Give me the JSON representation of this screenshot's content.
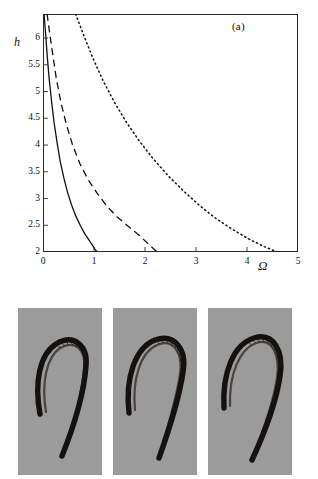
{
  "figure": {
    "panels": [
      {
        "id": "a",
        "label": "(a)"
      },
      {
        "id": "b",
        "label": "(b)"
      },
      {
        "id": "c",
        "label": "(c)"
      },
      {
        "id": "d",
        "label": "(d)"
      }
    ]
  },
  "chart_data": {
    "type": "line",
    "title": "",
    "panel_label": "(a)",
    "xlabel": "Ω",
    "ylabel": "h",
    "xlim": [
      0,
      5
    ],
    "ylim": [
      2,
      6.45
    ],
    "xticks": [
      0,
      1,
      2,
      3,
      4,
      5
    ],
    "xtick_labels": [
      "0",
      "1",
      "2",
      "3",
      "4",
      "5"
    ],
    "yticks": [
      2,
      2.5,
      3,
      3.5,
      4,
      4.5,
      5,
      5.5,
      6
    ],
    "ytick_labels": [
      "2",
      "2.5",
      "3",
      "3.5",
      "4",
      "4.5",
      "5",
      "5.5",
      "6"
    ],
    "grid": false,
    "legend": "none",
    "series": [
      {
        "name": "solid-curve",
        "style": "solid",
        "color": "#111111",
        "x": [
          0.02,
          0.05,
          0.08,
          0.12,
          0.17,
          0.22,
          0.28,
          0.34,
          0.41,
          0.48,
          0.56,
          0.64,
          0.73,
          0.82,
          0.92,
          1.02,
          1.06
        ],
        "y": [
          6.45,
          6.1,
          5.7,
          5.25,
          4.8,
          4.4,
          4.02,
          3.68,
          3.38,
          3.12,
          2.88,
          2.68,
          2.5,
          2.34,
          2.2,
          2.05,
          2.0
        ]
      },
      {
        "name": "dashed-curve",
        "style": "dashed",
        "color": "#111111",
        "x": [
          0.08,
          0.13,
          0.19,
          0.26,
          0.35,
          0.46,
          0.58,
          0.72,
          0.88,
          1.06,
          1.25,
          1.45,
          1.67,
          1.9,
          2.1,
          2.24
        ],
        "y": [
          6.45,
          6.1,
          5.7,
          5.25,
          4.8,
          4.38,
          4.0,
          3.66,
          3.36,
          3.1,
          2.86,
          2.66,
          2.48,
          2.3,
          2.12,
          2.0
        ]
      },
      {
        "name": "dotted-curve",
        "style": "dotted",
        "color": "#111111",
        "x": [
          0.64,
          0.8,
          0.98,
          1.18,
          1.4,
          1.64,
          1.9,
          2.18,
          2.48,
          2.78,
          3.08,
          3.4,
          3.72,
          4.04,
          4.34,
          4.6
        ],
        "y": [
          6.45,
          6.05,
          5.62,
          5.2,
          4.8,
          4.42,
          4.06,
          3.72,
          3.4,
          3.12,
          2.86,
          2.62,
          2.42,
          2.24,
          2.1,
          2.0
        ]
      }
    ]
  },
  "subfigures": [
    {
      "id": "b",
      "label": "(b)",
      "background_color": "#9b9b9b",
      "filament_color": "#15110f",
      "description": "hairpin filament snapshot"
    },
    {
      "id": "c",
      "label": "(c)",
      "background_color": "#9b9b9b",
      "filament_color": "#15110f",
      "description": "hairpin filament snapshot"
    },
    {
      "id": "d",
      "label": "(d)",
      "background_color": "#9b9b9b",
      "filament_color": "#15110f",
      "description": "hairpin filament snapshot"
    }
  ]
}
